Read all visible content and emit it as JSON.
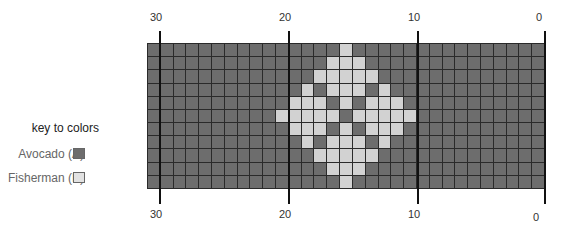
{
  "scale": {
    "top_labels": [
      "30",
      "20",
      "10",
      "0"
    ],
    "bottom_labels": [
      "30",
      "20",
      "10",
      "0"
    ]
  },
  "key": {
    "title": "key to colors",
    "items": [
      {
        "label": "Avocado (A)",
        "code": "A",
        "color": "#6d6d6d"
      },
      {
        "label": "Fisherman (B)",
        "code": "B",
        "color": "#e2e2e2"
      }
    ]
  },
  "colors": {
    "A": "#6d6d6d",
    "B": "#d2d2d2",
    "gridline": "#2a2a2a"
  },
  "grid": {
    "columns": 31,
    "rows": 11,
    "pattern": [
      "AAAAAAAAAAAAAAABAAAAAAAAAAAAAAA",
      "AAAAAAAAAAAAAABBBAAAAAAAAAAAAAA",
      "AAAAAAAAAAAAABBBBBAAAAAAAAAAAAA",
      "AAAAAAAAAAAABABBBABAAAAAAAAAAAA",
      "AAAAAAAAAAABBBABABBBAAAAAAAAAAA",
      "AAAAAAAAAABBBBBABBBBBAAAAAAAAAA",
      "AAAAAAAAAAABBBABABBBAAAAAAAAAAA",
      "AAAAAAAAAAAABABBBABAAAAAAAAAAAA",
      "AAAAAAAAAAAAABBBBBAAAAAAAAAAAAA",
      "AAAAAAAAAAAAAABBBAAAAAAAAAAAAAA",
      "AAAAAAAAAAAAAAABAAAAAAAAAAAAAAA"
    ]
  }
}
